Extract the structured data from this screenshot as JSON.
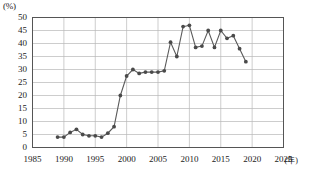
{
  "chart_data": {
    "type": "line",
    "title": "",
    "subtitle": "",
    "xlabel": "年",
    "ylabel": "%",
    "unit_label": "(%)",
    "x_unit_label": "(年)",
    "xlim": [
      1985,
      2025
    ],
    "ylim": [
      0,
      50
    ],
    "xticks": [
      1985,
      1990,
      1995,
      2000,
      2005,
      2010,
      2015,
      2020,
      2025
    ],
    "yticks": [
      0,
      5,
      10,
      15,
      20,
      25,
      30,
      35,
      40,
      45,
      50
    ],
    "grid": "both",
    "legend": "none",
    "marker": "filled-circle",
    "line_color": "#5a5a5a",
    "marker_color": "#4a4a4a",
    "grid_color": "#b8b8b8",
    "axis_color": "#555555",
    "series": [
      {
        "name": "series-1",
        "x": [
          1989,
          1990,
          1991,
          1992,
          1993,
          1994,
          1995,
          1996,
          1997,
          1998,
          1999,
          2000,
          2001,
          2002,
          2003,
          2004,
          2005,
          2006,
          2007,
          2008,
          2009,
          2010,
          2011,
          2012,
          2013,
          2014,
          2015,
          2016,
          2017,
          2018,
          2019
        ],
        "values": [
          4.0,
          4.0,
          5.8,
          7.0,
          5.0,
          4.5,
          4.5,
          4.0,
          5.5,
          8.0,
          20.0,
          27.5,
          30.0,
          28.5,
          29.0,
          29.0,
          29.0,
          29.5,
          40.5,
          35.0,
          46.5,
          47.0,
          38.5,
          39.0,
          45.0,
          38.5,
          45.0,
          42.0,
          43.0,
          38.0,
          33.0
        ]
      }
    ]
  },
  "axis": {
    "y_labels": [
      "50",
      "45",
      "40",
      "35",
      "30",
      "25",
      "20",
      "15",
      "10",
      "5",
      "0"
    ],
    "x_labels": [
      "1985",
      "1990",
      "1995",
      "2000",
      "2005",
      "2010",
      "2015",
      "2020",
      "2025"
    ]
  }
}
